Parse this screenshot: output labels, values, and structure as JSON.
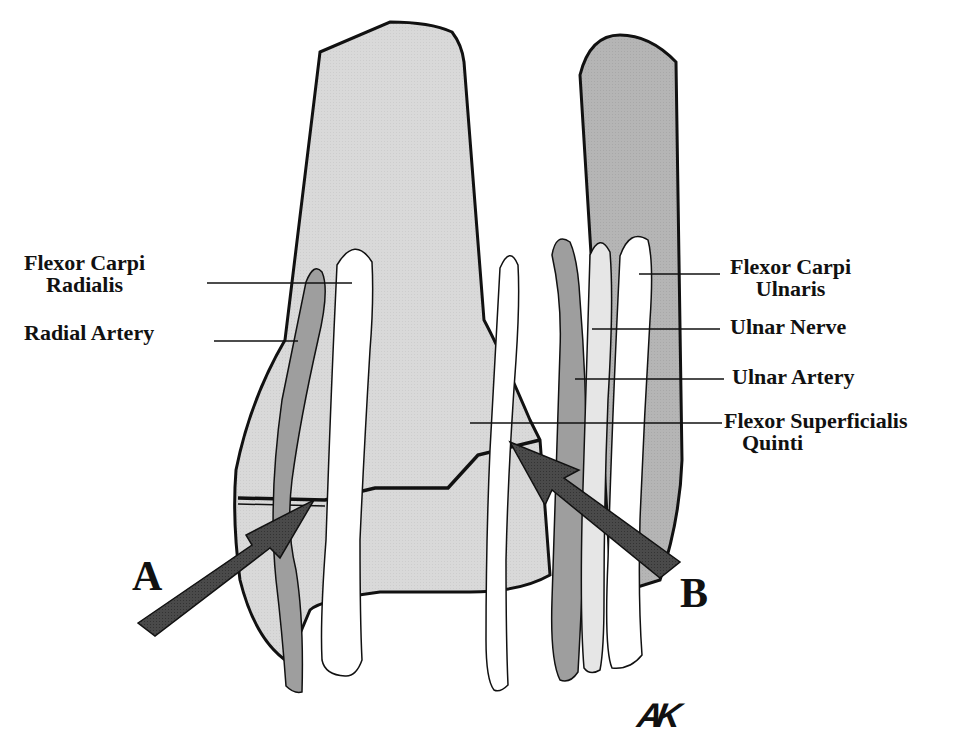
{
  "diagram": {
    "colors": {
      "bone_light": "#d9d9d9",
      "bone_dark": "#b3b3b3",
      "artery": "#9e9e9e",
      "nerve": "#e6e6e6",
      "tendon": "#ffffff",
      "arrow": "#4a4a4a",
      "outline": "#111111"
    },
    "labels": {
      "flexor_carpi_radialis": [
        "Flexor Carpi",
        "Radialis"
      ],
      "radial_artery": "Radial Artery",
      "flexor_carpi_ulnaris": [
        "Flexor Carpi",
        "Ulnaris"
      ],
      "ulnar_nerve": "Ulnar Nerve",
      "ulnar_artery": "Ulnar Artery",
      "flexor_superficialis_quinti": [
        "Flexor Superficialis",
        "Quinti"
      ]
    },
    "arrows": {
      "a": "A",
      "b": "B"
    },
    "signature": "AK"
  }
}
